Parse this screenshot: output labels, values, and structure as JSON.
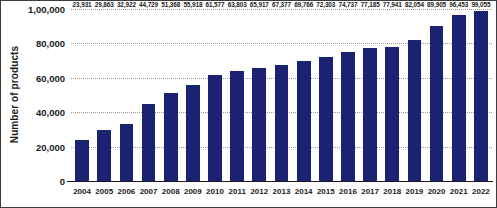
{
  "chart_data": {
    "type": "bar",
    "title": "",
    "xlabel": "",
    "ylabel": "Number of products",
    "ylim": [
      0,
      100000
    ],
    "grid": true,
    "legend": false,
    "bar_color": "#1c2272",
    "categories": [
      "2004",
      "2005",
      "2006",
      "2007",
      "2008",
      "2009",
      "2010",
      "2011",
      "2012",
      "2013",
      "2014",
      "2015",
      "2016",
      "2017",
      "2018",
      "2019",
      "2020",
      "2021",
      "2022"
    ],
    "values": [
      23931,
      29863,
      32922,
      44729,
      51368,
      55918,
      61577,
      63803,
      65917,
      67377,
      69766,
      72303,
      74737,
      77185,
      77941,
      82054,
      89905,
      96453,
      99055
    ],
    "value_labels": [
      "23,931",
      "29,863",
      "32,922",
      "44,729",
      "51,368",
      "55,918",
      "61,577",
      "63,803",
      "65,917",
      "67,377",
      "69,766",
      "72,303",
      "74,737",
      "77,185",
      "77,941",
      "82,054",
      "89,905",
      "96,453",
      "99,055"
    ],
    "yticks": [
      0,
      20000,
      40000,
      60000,
      80000,
      100000
    ],
    "ytick_labels": [
      "0",
      "20,000",
      "40,000",
      "60,000",
      "80,000",
      "1,00,000"
    ]
  }
}
